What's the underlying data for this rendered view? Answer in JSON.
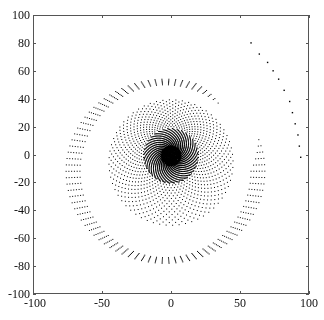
{
  "chart_data": {
    "type": "scatter",
    "title": "",
    "xlabel": "",
    "ylabel": "",
    "xlim": [
      -100,
      100
    ],
    "ylim": [
      -100,
      100
    ],
    "xticks": [
      -100,
      -50,
      0,
      50,
      100
    ],
    "yticks": [
      -100,
      -80,
      -60,
      -40,
      -20,
      0,
      20,
      40,
      60,
      80,
      100
    ],
    "xtick_labels": [
      "-100",
      "-50",
      "0",
      "50",
      "100"
    ],
    "ytick_labels": [
      "100",
      "80",
      "60",
      "40",
      "20",
      "0",
      "-20",
      "-40",
      "-60",
      "-80",
      "-100"
    ],
    "grid": false,
    "legend": null,
    "series": [
      {
        "name": "spiral-points",
        "marker": "dot",
        "color": "#000000",
        "rings": [
          {
            "r_inner": 0,
            "r_outer": 9,
            "density": "very-dense"
          },
          {
            "r_inner": 9,
            "r_outer": 20,
            "density": "dense-swirl"
          },
          {
            "r_inner": 20,
            "r_outer": 46,
            "density": "medium"
          },
          {
            "r_inner": 60,
            "r_outer": 84,
            "density": "sparse"
          }
        ],
        "tail": [
          [
            58,
            80
          ],
          [
            64,
            72
          ],
          [
            70,
            66
          ],
          [
            74,
            60
          ],
          [
            78,
            54
          ],
          [
            82,
            46
          ],
          [
            86,
            38
          ],
          [
            88,
            30
          ],
          [
            90,
            22
          ],
          [
            92,
            14
          ],
          [
            93,
            6
          ],
          [
            94,
            -2
          ]
        ]
      }
    ]
  }
}
